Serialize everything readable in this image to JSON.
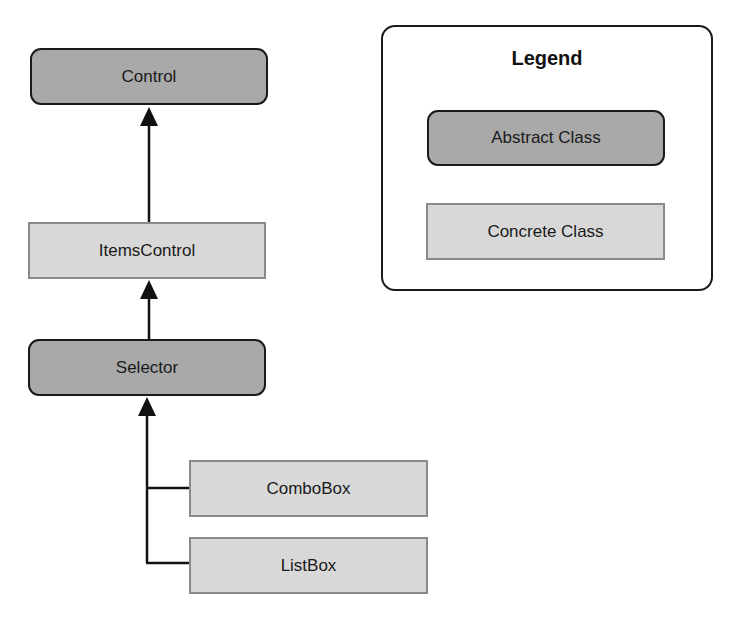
{
  "diagram": {
    "type": "class-hierarchy",
    "nodes": [
      {
        "id": "control",
        "label": "Control",
        "kind": "abstract"
      },
      {
        "id": "itemscontrol",
        "label": "ItemsControl",
        "kind": "concrete"
      },
      {
        "id": "selector",
        "label": "Selector",
        "kind": "abstract"
      },
      {
        "id": "combobox",
        "label": "ComboBox",
        "kind": "concrete"
      },
      {
        "id": "listbox",
        "label": "ListBox",
        "kind": "concrete"
      }
    ],
    "edges": [
      {
        "from": "itemscontrol",
        "to": "control",
        "type": "inheritance"
      },
      {
        "from": "selector",
        "to": "itemscontrol",
        "type": "inheritance"
      },
      {
        "from": "combobox",
        "to": "selector",
        "type": "inheritance"
      },
      {
        "from": "listbox",
        "to": "selector",
        "type": "inheritance"
      }
    ]
  },
  "legend": {
    "title": "Legend",
    "items": [
      {
        "label": "Abstract Class",
        "kind": "abstract"
      },
      {
        "label": "Concrete Class",
        "kind": "concrete"
      }
    ]
  },
  "colors": {
    "abstract_fill": "#a9a9a9",
    "abstract_border": "#1a1a1a",
    "concrete_fill": "#d8d8d8",
    "concrete_border": "#8a8a8a",
    "edge": "#111111"
  }
}
